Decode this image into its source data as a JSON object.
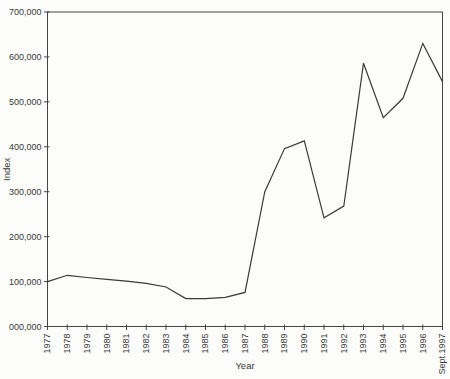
{
  "figure": {
    "background": "#fcfcfb",
    "axis_color": "#454545",
    "line_color": "#3a3a3a",
    "text_color": "#3a3a3a"
  },
  "chart_data": {
    "type": "line",
    "title": "",
    "xlabel": "Year",
    "ylabel": "Index",
    "categories": [
      "1977",
      "1978",
      "1979",
      "1980",
      "1981",
      "1982",
      "1983",
      "1984",
      "1985",
      "1986",
      "1987",
      "1988",
      "1989",
      "1990",
      "1991",
      "1992",
      "1993",
      "1994",
      "1995",
      "1996",
      "Sept.1997"
    ],
    "values": [
      100000,
      114000,
      109000,
      105000,
      101000,
      96000,
      88000,
      62000,
      62000,
      65000,
      76000,
      300000,
      396000,
      413000,
      242000,
      268000,
      586000,
      465000,
      508000,
      630000,
      545000
    ],
    "ylim": [
      0,
      700000
    ],
    "ytick_step": 100000,
    "ytick_labels": [
      "000,000",
      "100,000",
      "200,000",
      "300,000",
      "400,000",
      "500,000",
      "600,000",
      "700,000"
    ],
    "grid": false,
    "legend": null,
    "series_count": 1
  }
}
